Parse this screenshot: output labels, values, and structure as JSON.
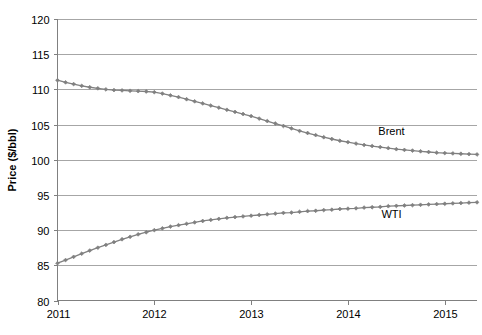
{
  "chart_data": {
    "type": "line",
    "title": "",
    "subtitle": "",
    "xlabel": "",
    "ylabel": "Price ($/bbl)",
    "ylim": [
      80,
      120
    ],
    "xlim": [
      2011,
      2015.333
    ],
    "y_ticks": [
      80,
      85,
      90,
      95,
      100,
      105,
      110,
      115,
      120
    ],
    "y_tick_labels": [
      "80",
      "85",
      "90",
      "95",
      "100",
      "105",
      "110",
      "115",
      "120"
    ],
    "x_ticks": [
      2011,
      2012,
      2013,
      2014,
      2015
    ],
    "x_tick_labels": [
      "2011",
      "2012",
      "2013",
      "2014",
      "2015"
    ],
    "grid": "horizontal",
    "legend_position": "inline-end-of-line",
    "marker": "diamond",
    "line_color": "#808080",
    "marker_color": "#808080",
    "gridline_color": "#a6a6a6",
    "axis_color": "#808080",
    "background_color": "#ffffff",
    "series": [
      {
        "name": "Brent",
        "label": "Brent",
        "label_x": 2014.45,
        "label_y": 104.1,
        "x": [
          2011.0,
          2011.0833,
          2011.1667,
          2011.25,
          2011.3333,
          2011.4167,
          2011.5,
          2011.5833,
          2011.6667,
          2011.75,
          2011.8333,
          2011.9167,
          2012.0,
          2012.0833,
          2012.1667,
          2012.25,
          2012.3333,
          2012.4167,
          2012.5,
          2012.5833,
          2012.6667,
          2012.75,
          2012.8333,
          2012.9167,
          2013.0,
          2013.0833,
          2013.1667,
          2013.25,
          2013.3333,
          2013.4167,
          2013.5,
          2013.5833,
          2013.6667,
          2013.75,
          2013.8333,
          2013.9167,
          2014.0,
          2014.0833,
          2014.1667,
          2014.25,
          2014.3333,
          2014.4167,
          2014.5,
          2014.5833,
          2014.6667,
          2014.75,
          2014.8333,
          2014.9167,
          2015.0,
          2015.0833,
          2015.1667,
          2015.25,
          2015.3333
        ],
        "values": [
          111.3,
          111.0,
          110.75,
          110.5,
          110.3,
          110.15,
          110.0,
          109.9,
          109.85,
          109.8,
          109.75,
          109.7,
          109.6,
          109.4,
          109.15,
          108.9,
          108.6,
          108.3,
          108.0,
          107.7,
          107.4,
          107.1,
          106.8,
          106.5,
          106.2,
          105.85,
          105.5,
          105.15,
          104.8,
          104.45,
          104.1,
          103.8,
          103.5,
          103.2,
          102.95,
          102.7,
          102.5,
          102.3,
          102.1,
          101.95,
          101.8,
          101.65,
          101.5,
          101.4,
          101.3,
          101.2,
          101.1,
          101.0,
          100.95,
          100.9,
          100.85,
          100.8,
          100.75
        ]
      },
      {
        "name": "WTI",
        "label": "WTI",
        "label_x": 2014.45,
        "label_y": 92.3,
        "x": [
          2011.0,
          2011.0833,
          2011.1667,
          2011.25,
          2011.3333,
          2011.4167,
          2011.5,
          2011.5833,
          2011.6667,
          2011.75,
          2011.8333,
          2011.9167,
          2012.0,
          2012.0833,
          2012.1667,
          2012.25,
          2012.3333,
          2012.4167,
          2012.5,
          2012.5833,
          2012.6667,
          2012.75,
          2012.8333,
          2012.9167,
          2013.0,
          2013.0833,
          2013.1667,
          2013.25,
          2013.3333,
          2013.4167,
          2013.5,
          2013.5833,
          2013.6667,
          2013.75,
          2013.8333,
          2013.9167,
          2014.0,
          2014.0833,
          2014.1667,
          2014.25,
          2014.3333,
          2014.4167,
          2014.5,
          2014.5833,
          2014.6667,
          2014.75,
          2014.8333,
          2014.9167,
          2015.0,
          2015.0833,
          2015.1667,
          2015.25,
          2015.3333
        ],
        "values": [
          85.3,
          85.75,
          86.2,
          86.65,
          87.1,
          87.5,
          87.9,
          88.3,
          88.7,
          89.05,
          89.4,
          89.7,
          90.0,
          90.25,
          90.5,
          90.7,
          90.9,
          91.1,
          91.3,
          91.45,
          91.6,
          91.75,
          91.85,
          91.95,
          92.05,
          92.15,
          92.25,
          92.35,
          92.45,
          92.5,
          92.6,
          92.7,
          92.75,
          92.85,
          92.9,
          93.0,
          93.05,
          93.1,
          93.2,
          93.25,
          93.3,
          93.4,
          93.45,
          93.5,
          93.55,
          93.6,
          93.65,
          93.7,
          93.75,
          93.8,
          93.85,
          93.9,
          93.95
        ]
      }
    ]
  }
}
